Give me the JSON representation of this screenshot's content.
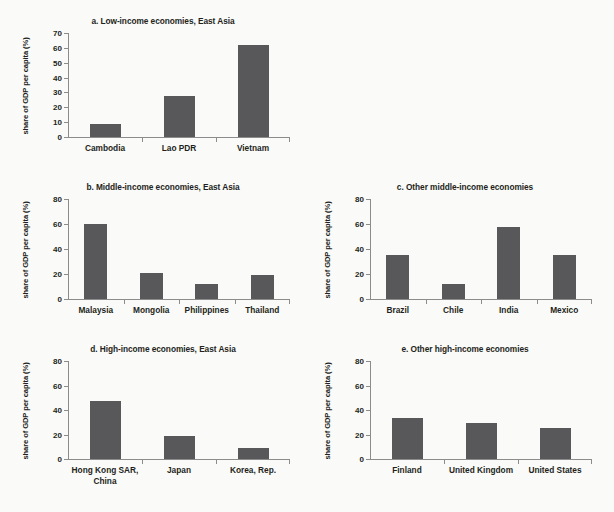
{
  "figure": {
    "background_color": "#fafaf8",
    "bar_color": "#58585a",
    "axis_color": "#8c8c8c",
    "text_color": "#231f20",
    "y_axis_title": "share of GDP per capita (%)"
  },
  "chart_data": [
    {
      "type": "bar",
      "panel": "a",
      "title": "a. Low-income economies, East Asia",
      "xlabel": "",
      "ylabel": "share of GDP per capita (%)",
      "ylim": [
        0,
        70
      ],
      "yticks": [
        0,
        10,
        20,
        30,
        40,
        50,
        60,
        70
      ],
      "grid": false,
      "legend": "none",
      "categories": [
        "Cambodia",
        "Lao PDR",
        "Vietnam"
      ],
      "values": [
        8.7,
        27.5,
        62
      ]
    },
    {
      "type": "bar",
      "panel": "b",
      "title": "b. Middle-income economies, East Asia",
      "xlabel": "",
      "ylabel": "share of GDP per capita (%)",
      "ylim": [
        0,
        80
      ],
      "yticks": [
        0,
        20,
        40,
        60,
        80
      ],
      "grid": false,
      "legend": "none",
      "categories": [
        "Malaysia",
        "Mongolia",
        "Philippines",
        "Thailand"
      ],
      "values": [
        60,
        21,
        12,
        19.5
      ]
    },
    {
      "type": "bar",
      "panel": "c",
      "title": "c. Other middle-income economies",
      "xlabel": "",
      "ylabel": "share of GDP per capita (%)",
      "ylim": [
        0,
        80
      ],
      "yticks": [
        0,
        20,
        40,
        60,
        80
      ],
      "grid": false,
      "legend": "none",
      "categories": [
        "Brazil",
        "Chile",
        "India",
        "Mexico"
      ],
      "values": [
        35,
        12,
        58,
        35.5
      ]
    },
    {
      "type": "bar",
      "panel": "d",
      "title": "d. High-income economies, East Asia",
      "xlabel": "",
      "ylabel": "share of GDP per capita (%)",
      "ylim": [
        0,
        80
      ],
      "yticks": [
        0,
        20,
        40,
        60,
        80
      ],
      "grid": false,
      "legend": "none",
      "categories": [
        "Hong Kong SAR,\nChina",
        "Japan",
        "Korea, Rep."
      ],
      "values": [
        47,
        19,
        9
      ]
    },
    {
      "type": "bar",
      "panel": "e",
      "title": "e. Other high-income economies",
      "xlabel": "",
      "ylabel": "share of GDP per capita (%)",
      "ylim": [
        0,
        80
      ],
      "yticks": [
        0,
        20,
        40,
        60,
        80
      ],
      "grid": false,
      "legend": "none",
      "categories": [
        "Finland",
        "United Kingdom",
        "United States"
      ],
      "values": [
        33.5,
        29,
        25.5
      ]
    }
  ]
}
